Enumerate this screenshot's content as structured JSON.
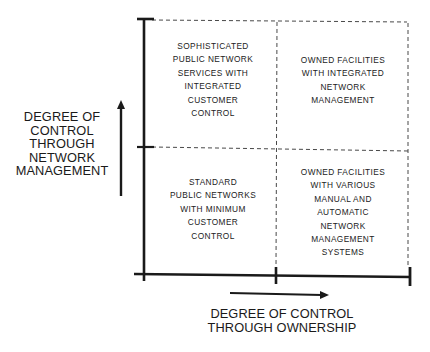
{
  "diagram": {
    "type": "2x2 matrix",
    "y_axis": {
      "label_lines": [
        "DEGREE OF",
        "CONTROL",
        "THROUGH",
        "NETWORK",
        "MANAGEMENT"
      ],
      "arrow": "up"
    },
    "x_axis": {
      "label_lines": [
        "DEGREE OF CONTROL",
        "THROUGH OWNERSHIP"
      ],
      "arrow": "right"
    },
    "quadrants": {
      "top_left": {
        "lines": [
          "SOPHISTICATED",
          "PUBLIC NETWORK",
          "SERVICES WITH",
          "INTEGRATED",
          "CUSTOMER",
          "CONTROL"
        ]
      },
      "top_right": {
        "lines": [
          "OWNED FACILITIES",
          "WITH INTEGRATED",
          "NETWORK",
          "MANAGEMENT"
        ]
      },
      "bottom_left": {
        "lines": [
          "STANDARD",
          "PUBLIC NETWORKS",
          "WITH MINIMUM",
          "CUSTOMER",
          "CONTROL"
        ]
      },
      "bottom_right": {
        "lines": [
          "OWNED FACILITIES",
          "WITH VARIOUS",
          "MANUAL AND",
          "AUTOMATIC",
          "NETWORK",
          "MANAGEMENT",
          "SYSTEMS"
        ]
      }
    },
    "colors": {
      "ink": "#1c1c1c",
      "background": "#ffffff"
    }
  }
}
